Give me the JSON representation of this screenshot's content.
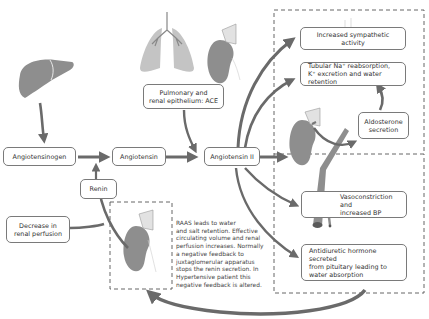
{
  "diagram": {
    "nodes": {
      "angiotensinogen": "Angiotensinogen",
      "angiotensin": "Angiotensin",
      "angiotensin_ii": "Angiotensin II",
      "renin": "Renin",
      "decrease_perfusion": "Decrease in\nrenal perfusion",
      "ace": "Pulmonary and\nrenal epithelium: ACE",
      "sympathetic": "Increased sympathetic activity",
      "tubular": "Tubular Na⁺ reabsorption,\nK⁺ excretion and water retention",
      "aldosterone": "Aldosterone\nsecretion",
      "vasoconstriction": "Vasoconstriction and\nincreased BP",
      "adh": "Antidiuretic hormone secreted\nfrom pituitary leading to\nwater absorption"
    },
    "note": "RAAS leads to water\nand salt retention. Effective\ncirculating volume and renal\nperfusion increases. Normally\na negative feedback to\njuxtaglomerular apparatus\nstops the renin secretion. In\nHypertensive patient this\nnegative feedback is altered.",
    "organs": [
      "liver-icon",
      "lungs-icon",
      "kidney-icon",
      "adrenal-gland-icon",
      "blood-vessel-icon",
      "nerve-signal-icon"
    ],
    "colors": {
      "organ_fill": "#8e8e8e",
      "lung_fill": "#c4c4c4",
      "arrow": "#6a6a6a",
      "box_border": "#7a7a7a",
      "dashed_border": "#555555"
    }
  }
}
